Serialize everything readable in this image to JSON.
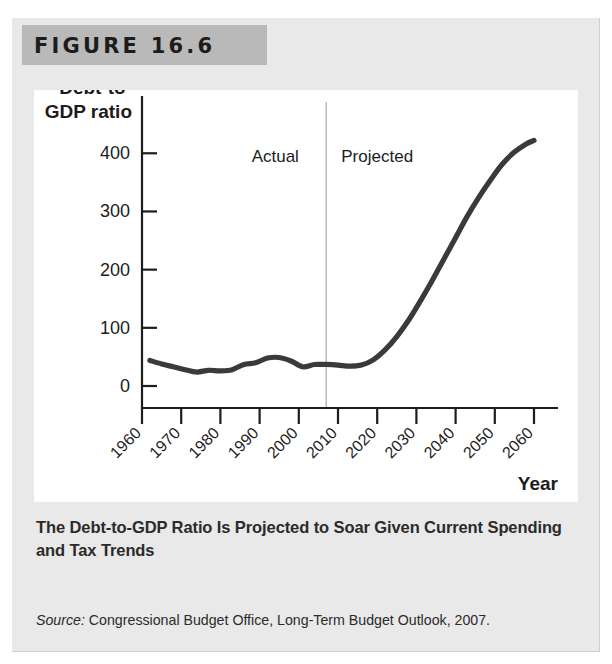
{
  "figure": {
    "header_label": "FIGURE 16.6",
    "caption": "The Debt-to-GDP Ratio Is Projected to Soar Given Current Spending and Tax Trends",
    "source_prefix": "Source:",
    "source_text": " Congressional Budget Office, Long-Term Budget Outlook, 2007."
  },
  "colors": {
    "panel_background": "#e9e9e9",
    "header_band": "#b9b9b9",
    "card_background": "#ffffff",
    "line": "#3a3a3a",
    "axis": "#1c1c1c",
    "divider": "#b5b5b5",
    "text": "#1c1c1c"
  },
  "chart_data": {
    "type": "line",
    "title": "",
    "xlabel": "Year",
    "ylabel": "Debt-to-GDP ratio",
    "ylabel_lines": [
      "Debt-to-",
      "GDP ratio"
    ],
    "xlim": [
      1960,
      2060
    ],
    "ylim": [
      0,
      440
    ],
    "yticks": [
      0,
      100,
      200,
      300,
      400
    ],
    "ytick_labels": [
      "0",
      "100",
      "200",
      "300",
      "400"
    ],
    "xticks": [
      1960,
      1970,
      1980,
      1990,
      2000,
      2010,
      2020,
      2030,
      2040,
      2050,
      2060
    ],
    "xtick_labels": [
      "1960",
      "1970",
      "1980",
      "1990",
      "2000",
      "2010",
      "2020",
      "2030",
      "2040",
      "2050",
      "2060"
    ],
    "grid": false,
    "legend": "none",
    "annotations": [
      {
        "name": "actual-label",
        "text": "Actual",
        "x": 1994,
        "y": 385
      },
      {
        "name": "projected-label",
        "text": "Projected",
        "x": 2020,
        "y": 385
      }
    ],
    "divider_x": 2007,
    "series": [
      {
        "name": "Debt-to-GDP ratio",
        "x": [
          1962,
          1965,
          1968,
          1971,
          1974,
          1977,
          1980,
          1983,
          1986,
          1989,
          1992,
          1995,
          1998,
          2001,
          2004,
          2007,
          2010,
          2013,
          2016,
          2019,
          2022,
          2025,
          2028,
          2031,
          2034,
          2037,
          2040,
          2043,
          2046,
          2049,
          2052,
          2055,
          2058,
          2060
        ],
        "y": [
          44,
          38,
          33,
          28,
          24,
          27,
          26,
          28,
          37,
          40,
          48,
          49,
          43,
          33,
          37,
          37,
          36,
          34,
          36,
          45,
          62,
          85,
          113,
          146,
          181,
          218,
          255,
          292,
          325,
          355,
          382,
          402,
          416,
          422
        ]
      }
    ]
  }
}
